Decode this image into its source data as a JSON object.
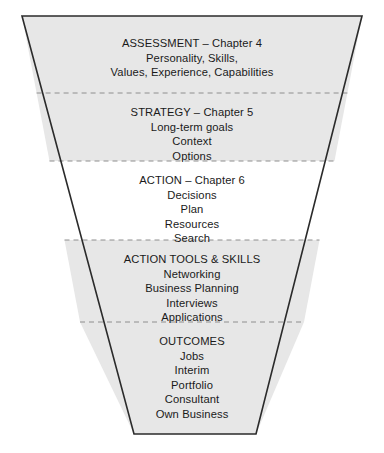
{
  "diagram": {
    "type": "funnel",
    "colors": {
      "shaded_fill": "#e7e7e7",
      "plain_fill": "#ffffff",
      "outline": "#2b2b2b",
      "divider": "#8e8e8e",
      "text": "#1a1a1a"
    },
    "geometry": {
      "top_left_x": 22,
      "top_right_x": 362,
      "top_y": 16,
      "bottom_left_x": 134,
      "bottom_right_x": 256,
      "bottom_y": 434,
      "divider_y": [
        93,
        161,
        240,
        322
      ],
      "center_x": 192
    },
    "bands": [
      {
        "id": "assessment",
        "heading": "ASSESSMENT – Chapter 4",
        "shaded": true,
        "items": [
          "Personality, Skills,",
          "Values, Experience, Capabilities"
        ]
      },
      {
        "id": "strategy",
        "heading": "STRATEGY – Chapter 5",
        "shaded": true,
        "items": [
          "Long-term goals",
          "Context",
          "Options"
        ]
      },
      {
        "id": "action",
        "heading": "ACTION – Chapter 6",
        "shaded": false,
        "items": [
          "Decisions",
          "Plan",
          "Resources",
          "Search"
        ]
      },
      {
        "id": "action-tools-skills",
        "heading": "ACTION TOOLS & SKILLS",
        "shaded": true,
        "items": [
          "Networking",
          "Business Planning",
          "Interviews",
          "Applications"
        ]
      },
      {
        "id": "outcomes",
        "heading": "OUTCOMES",
        "shaded": true,
        "items": [
          "Jobs",
          "Interim",
          "Portfolio",
          "Consultant",
          "Own Business"
        ]
      }
    ]
  }
}
